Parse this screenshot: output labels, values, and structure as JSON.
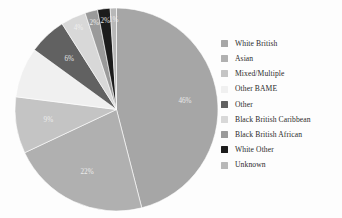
{
  "chart_data": {
    "type": "pie",
    "title": "",
    "subtitle": "",
    "xlabel": "",
    "ylabel": "",
    "grid": false,
    "legend_position": "right",
    "start_angle_deg": 0,
    "direction": "clockwise",
    "categories": [
      "White British",
      "Asian",
      "Mixed/Multiple",
      "Other BAME",
      "Other",
      "Black British Caribbean",
      "Black British African",
      "White Other",
      "Unknown"
    ],
    "values": [
      46,
      22,
      9,
      8,
      6,
      4,
      2,
      2,
      1
    ],
    "data_labels": [
      "46%",
      "22%",
      "9%",
      "",
      "6%",
      "4%",
      "2%",
      "2%",
      "1%"
    ],
    "colors": [
      "#a6a6a6",
      "#b0b0b0",
      "#c4c4c4",
      "#f0f0f0",
      "#616161",
      "#d8d8d8",
      "#9a9a9a",
      "#1c1c1c",
      "#b8b8b8"
    ],
    "slices": [
      {
        "label": "White British",
        "value": 46,
        "data_label": "46%",
        "color": "#a6a6a6"
      },
      {
        "label": "Asian",
        "value": 22,
        "data_label": "22%",
        "color": "#b0b0b0"
      },
      {
        "label": "Mixed/Multiple",
        "value": 9,
        "data_label": "9%",
        "color": "#c4c4c4"
      },
      {
        "label": "Other BAME",
        "value": 8,
        "data_label": "",
        "color": "#f0f0f0"
      },
      {
        "label": "Other",
        "value": 6,
        "data_label": "6%",
        "color": "#616161"
      },
      {
        "label": "Black British Caribbean",
        "value": 4,
        "data_label": "4%",
        "color": "#d8d8d8"
      },
      {
        "label": "Black British African",
        "value": 2,
        "data_label": "2%",
        "color": "#9a9a9a"
      },
      {
        "label": "White Other",
        "value": 2,
        "data_label": "2%",
        "color": "#1c1c1c"
      },
      {
        "label": "Unknown",
        "value": 1,
        "data_label": "1%",
        "color": "#b8b8b8"
      }
    ]
  },
  "legend": {
    "items": [
      {
        "label": "White British",
        "color": "#a6a6a6"
      },
      {
        "label": "Asian",
        "color": "#b0b0b0"
      },
      {
        "label": "Mixed/Multiple",
        "color": "#c4c4c4"
      },
      {
        "label": "Other BAME",
        "color": "#f0f0f0"
      },
      {
        "label": "Other",
        "color": "#616161"
      },
      {
        "label": "Black British Caribbean",
        "color": "#d8d8d8"
      },
      {
        "label": "Black British African",
        "color": "#9a9a9a"
      },
      {
        "label": "White Other",
        "color": "#1c1c1c"
      },
      {
        "label": "Unknown",
        "color": "#b8b8b8"
      }
    ]
  },
  "figure": {
    "background": "#fdfdfd",
    "label_color": "#f2f2f2"
  }
}
